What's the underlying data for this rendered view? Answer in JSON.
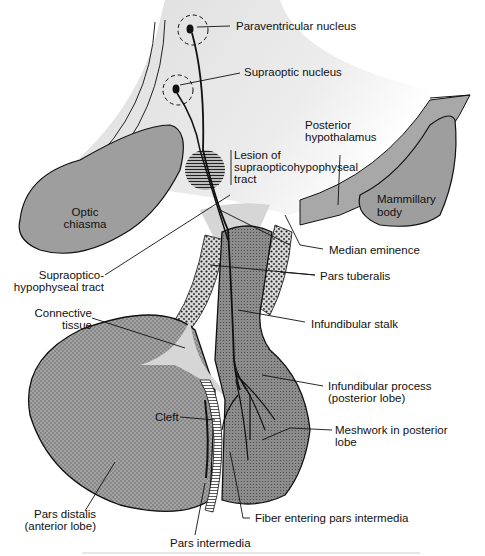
{
  "figure": {
    "type": "anatomical-diagram",
    "colors": {
      "tissue_gray": "#9a9a9a",
      "light_gray": "#d4d4d4",
      "background_gradient": "#e6e6e6",
      "outline": "#111111"
    }
  },
  "labels": {
    "paraventricular": "Paraventricular nucleus",
    "supraoptic": "Supraoptic nucleus",
    "posterior_hypothalamus_1": "Posterior",
    "posterior_hypothalamus_2": "hypothalamus",
    "lesion_1": "Lesion of",
    "lesion_2": "supraopticohypophyseal",
    "lesion_3": "tract",
    "optic_1": "Optic",
    "optic_2": "chiasma",
    "mammillary_1": "Mammillary",
    "mammillary_2": "body",
    "median_eminence": "Median eminence",
    "supraoptico_tract_1": "Supraoptico-",
    "supraoptico_tract_2": "hypophyseal tract",
    "pars_tuberalis": "Pars tuberalis",
    "connective_1": "Connective",
    "connective_2": "tissue",
    "infundibular_stalk": "Infundibular stalk",
    "infundibular_process_1": "Infundibular process",
    "infundibular_process_2": "(posterior lobe)",
    "cleft": "Cleft",
    "meshwork_1": "Meshwork in posterior",
    "meshwork_2": "lobe",
    "pars_distalis_1": "Pars distalis",
    "pars_distalis_2": "(anterior lobe)",
    "fiber_entering": "Fiber entering pars intermedia",
    "pars_intermedia": "Pars intermedia"
  }
}
